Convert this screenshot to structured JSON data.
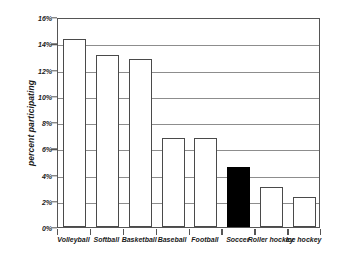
{
  "chart_data": {
    "type": "bar",
    "title": "",
    "subtitle": "",
    "xlabel": "",
    "ylabel": "percent participating",
    "ylim": [
      0,
      16
    ],
    "ytick_step": 2,
    "ytick_labels": [
      "16%",
      "14%",
      "12%",
      "10%",
      "8%",
      "6%",
      "4%",
      "2%",
      "0%"
    ],
    "ytick_values": [
      16,
      14,
      12,
      10,
      8,
      6,
      4,
      2,
      0
    ],
    "grid": true,
    "legend": false,
    "legend_position": "none",
    "categories": [
      "Volleyball",
      "Softball",
      "Basketball",
      "Baseball",
      "Football",
      "Soccer",
      "Roller hockey",
      "Ice hockey"
    ],
    "values": [
      14.3,
      13.1,
      12.8,
      6.8,
      6.75,
      4.6,
      3.05,
      2.3
    ],
    "highlight_index": 5,
    "bar_fill_default": "#ffffff",
    "bar_fill_highlight": "#000000",
    "bar_edge_color": "#4a4a4a",
    "grid_color": "#8d8d8d",
    "axis_color": "#555555",
    "background": "#ffffff"
  }
}
